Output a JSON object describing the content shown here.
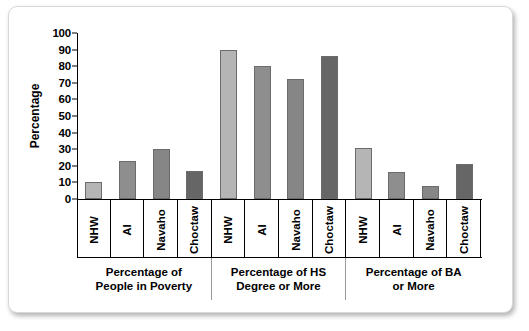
{
  "chart_data": {
    "type": "bar",
    "title": "",
    "xlabel": "",
    "ylabel": "Percentage",
    "ylim": [
      0,
      100
    ],
    "yticks": [
      0,
      10,
      20,
      30,
      40,
      50,
      60,
      70,
      80,
      90,
      100
    ],
    "grid": false,
    "legend": "none",
    "categories": [
      "NHW",
      "AI",
      "Navaho",
      "Choctaw"
    ],
    "groups": [
      {
        "label_line1": "Percentage of",
        "label_line2": "People in Poverty",
        "bars": [
          {
            "category": "NHW",
            "value": 10,
            "color": "#b5b5b5"
          },
          {
            "category": "AI",
            "value": 23,
            "color": "#8e8e8e"
          },
          {
            "category": "Navaho",
            "value": 30,
            "color": "#868686"
          },
          {
            "category": "Choctaw",
            "value": 17,
            "color": "#666666"
          }
        ]
      },
      {
        "label_line1": "Percentage of HS",
        "label_line2": "Degree or More",
        "bars": [
          {
            "category": "NHW",
            "value": 90,
            "color": "#b5b5b5"
          },
          {
            "category": "AI",
            "value": 80,
            "color": "#8e8e8e"
          },
          {
            "category": "Navaho",
            "value": 72,
            "color": "#868686"
          },
          {
            "category": "Choctaw",
            "value": 86,
            "color": "#666666"
          }
        ]
      },
      {
        "label_line1": "Percentage of BA",
        "label_line2": "or More",
        "bars": [
          {
            "category": "NHW",
            "value": 31,
            "color": "#b5b5b5"
          },
          {
            "category": "AI",
            "value": 16,
            "color": "#8e8e8e"
          },
          {
            "category": "Navaho",
            "value": 8,
            "color": "#868686"
          },
          {
            "category": "Choctaw",
            "value": 21,
            "color": "#666666"
          }
        ]
      }
    ],
    "colors": {
      "bar_border": "#6b6b6b",
      "axis": "#000000",
      "frame_border": "#d8d8d8",
      "background": "#ffffff"
    }
  }
}
